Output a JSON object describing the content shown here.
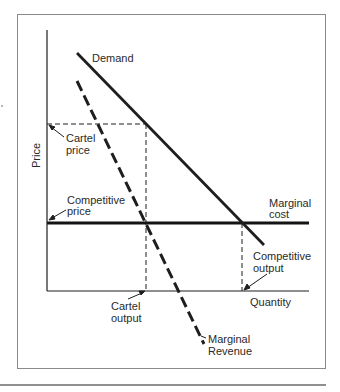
{
  "diagram": {
    "type": "economics-cartel-diagram",
    "axes": {
      "y_label": "Price",
      "x_label": "Quantity"
    },
    "curves": {
      "demand": "Demand",
      "marginal_revenue_line1": "Marginal",
      "marginal_revenue_line2": "Revenue",
      "marginal_cost_line1": "Marginal",
      "marginal_cost_line2": "cost"
    },
    "annotations": {
      "cartel_price_line1": "Cartel",
      "cartel_price_line2": "price",
      "competitive_price_line1": "Competitive",
      "competitive_price_line2": "price",
      "cartel_output_line1": "Cartel",
      "cartel_output_line2": "output",
      "competitive_output_line1": "Competitive",
      "competitive_output_line2": "output"
    },
    "colors": {
      "line": "#1e1e1e",
      "frame": "#8a8a8a",
      "text": "#2a2a2a"
    }
  }
}
